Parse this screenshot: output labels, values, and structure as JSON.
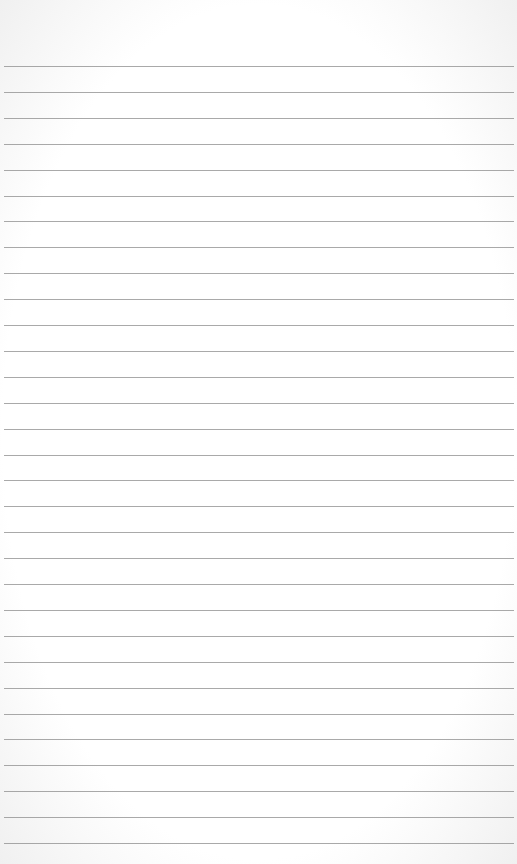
{
  "paper": {
    "type": "lined-notepaper",
    "background_color": "#ffffff",
    "line_color": "#8c8c8c",
    "first_line_y": 66,
    "line_spacing": 25.9,
    "line_count": 31
  }
}
